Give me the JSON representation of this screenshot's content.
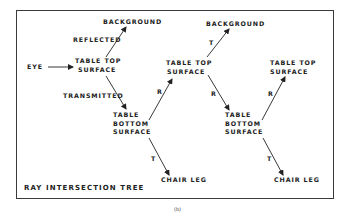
{
  "diagram": {
    "title": "RAY INTERSECTION TREE",
    "caption": "(b)",
    "nodes": {
      "eye": "EYE",
      "background_1": "BACKGROUND",
      "table_top_1": [
        "TABLE TOP",
        "SURFACE"
      ],
      "table_bottom_1": [
        "TABLE",
        "BOTTOM",
        "SURFACE"
      ],
      "chair_leg_1": "CHAIR LEG",
      "table_top_2": [
        "TABLE TOP",
        "SURFACE"
      ],
      "background_2": "BACKGROUND",
      "table_bottom_2": [
        "TABLE",
        "BOTTOM",
        "SURFACE"
      ],
      "table_top_3": [
        "TABLE TOP",
        "SURFACE"
      ],
      "chair_leg_2": "CHAIR LEG"
    },
    "edges": {
      "reflected": "REFLECTED",
      "transmitted": "TRANSMITTED",
      "r1": "R",
      "t1": "T",
      "t2": "T",
      "r2": "R",
      "r3": "R",
      "t3": "T"
    },
    "colors": {
      "ink": "#222222",
      "frame": "#3a3a3a",
      "background": "#ffffff"
    }
  }
}
